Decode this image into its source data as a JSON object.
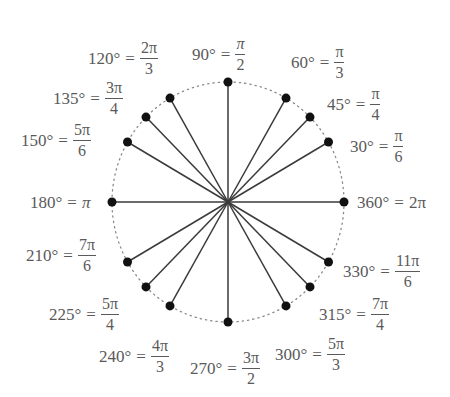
{
  "chart_data": {
    "type": "diagram",
    "title": "",
    "center": [
      228,
      202
    ],
    "radius_x": 116,
    "radius_y": 120,
    "circle_style": "dotted",
    "angles": [
      {
        "deg": 30,
        "deg_label": "30°",
        "rad_num": "π",
        "rad_den": "6",
        "rad_inline": ""
      },
      {
        "deg": 45,
        "deg_label": "45°",
        "rad_num": "π",
        "rad_den": "4",
        "rad_inline": ""
      },
      {
        "deg": 60,
        "deg_label": "60°",
        "rad_num": "π",
        "rad_den": "3",
        "rad_inline": ""
      },
      {
        "deg": 90,
        "deg_label": "90°",
        "rad_num": "π",
        "rad_den": "2",
        "rad_inline": ""
      },
      {
        "deg": 120,
        "deg_label": "120°",
        "rad_num": "2π",
        "rad_den": "3",
        "rad_inline": ""
      },
      {
        "deg": 135,
        "deg_label": "135°",
        "rad_num": "3π",
        "rad_den": "4",
        "rad_inline": ""
      },
      {
        "deg": 150,
        "deg_label": "150°",
        "rad_num": "5π",
        "rad_den": "6",
        "rad_inline": ""
      },
      {
        "deg": 180,
        "deg_label": "180°",
        "rad_num": "",
        "rad_den": "",
        "rad_inline": "π"
      },
      {
        "deg": 210,
        "deg_label": "210°",
        "rad_num": "7π",
        "rad_den": "6",
        "rad_inline": ""
      },
      {
        "deg": 225,
        "deg_label": "225°",
        "rad_num": "5π",
        "rad_den": "4",
        "rad_inline": ""
      },
      {
        "deg": 240,
        "deg_label": "240°",
        "rad_num": "4π",
        "rad_den": "3",
        "rad_inline": ""
      },
      {
        "deg": 270,
        "deg_label": "270°",
        "rad_num": "3π",
        "rad_den": "2",
        "rad_inline": ""
      },
      {
        "deg": 300,
        "deg_label": "300°",
        "rad_num": "5π",
        "rad_den": "3",
        "rad_inline": ""
      },
      {
        "deg": 315,
        "deg_label": "315°",
        "rad_num": "7π",
        "rad_den": "4",
        "rad_inline": ""
      },
      {
        "deg": 330,
        "deg_label": "330°",
        "rad_num": "11π",
        "rad_den": "6",
        "rad_inline": ""
      },
      {
        "deg": 360,
        "deg_label": "360°",
        "rad_num": "",
        "rad_den": "",
        "rad_inline": "2π"
      }
    ]
  },
  "labels": {
    "eq": "=",
    "a30": {
      "deg": "30°",
      "num": "π",
      "den": "6"
    },
    "a45": {
      "deg": "45°",
      "num": "π",
      "den": "4"
    },
    "a60": {
      "deg": "60°",
      "num": "π",
      "den": "3"
    },
    "a90": {
      "deg": "90°",
      "num": "π",
      "den": "2"
    },
    "a120": {
      "deg": "120°",
      "num": "2π",
      "den": "3"
    },
    "a135": {
      "deg": "135°",
      "num": "3π",
      "den": "4"
    },
    "a150": {
      "deg": "150°",
      "num": "5π",
      "den": "6"
    },
    "a180": {
      "deg": "180°",
      "val": "π"
    },
    "a210": {
      "deg": "210°",
      "num": "7π",
      "den": "6"
    },
    "a225": {
      "deg": "225°",
      "num": "5π",
      "den": "4"
    },
    "a240": {
      "deg": "240°",
      "num": "4π",
      "den": "3"
    },
    "a270": {
      "deg": "270°",
      "num": "3π",
      "den": "2"
    },
    "a300": {
      "deg": "300°",
      "num": "5π",
      "den": "3"
    },
    "a315": {
      "deg": "315°",
      "num": "7π",
      "den": "4"
    },
    "a330": {
      "deg": "330°",
      "num": "11π",
      "den": "6"
    },
    "a360": {
      "deg": "360°",
      "val": "2π"
    }
  },
  "colors": {
    "line": "#3a3a3a",
    "dot": "#111111",
    "circle": "#888888",
    "text": "#5a5a5a"
  }
}
